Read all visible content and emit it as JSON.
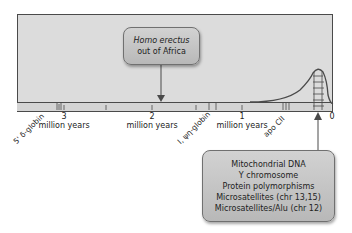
{
  "timeline": {
    "ticks": [
      {
        "value": "3",
        "unit": "million years"
      },
      {
        "value": "2",
        "unit": "million years"
      },
      {
        "value": "1",
        "unit": "million years"
      },
      {
        "value": "0",
        "unit": ""
      }
    ],
    "gene_markers": [
      {
        "label": "5' δ-globin"
      },
      {
        "label": "I, ψη-globin"
      },
      {
        "label": "apo CII"
      }
    ]
  },
  "events": {
    "homo_erectus": {
      "line1": "Homo erectus",
      "line2": "out of Africa"
    }
  },
  "recent_markers": {
    "items": [
      "Mitochondrial DNA",
      "Y chromosome",
      "Protein polymorphisms",
      "Microsatellites (chr 13,15)",
      "Microsatellites/Alu (chr 12)"
    ]
  }
}
